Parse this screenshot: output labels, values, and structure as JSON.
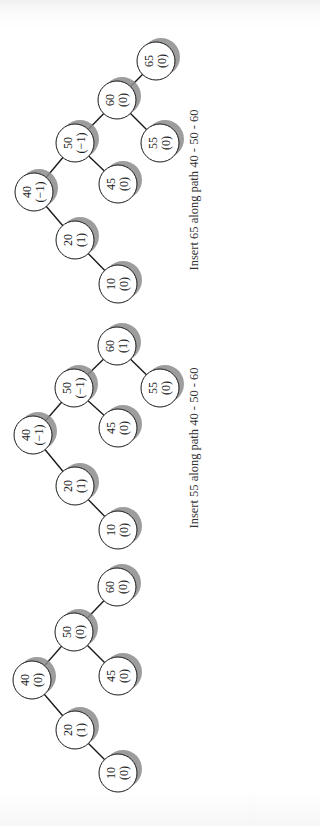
{
  "figure": {
    "orientation": "rotated -90deg (text reads bottom-to-top)",
    "node_radius": 19,
    "colors": {
      "node_fill": "#ffffff",
      "node_stroke": "#1a1a1a",
      "shadow": "#8c8c8c",
      "edge": "#1a1a1a",
      "text": "#222222"
    }
  },
  "trees": [
    {
      "id": "tree-insert-65",
      "caption": "Insert 65 along path 40 - 50 - 60",
      "caption_pos": {
        "x": 198,
        "y": 190
      },
      "nodes": [
        {
          "key": "65",
          "balance": "(0)",
          "x": 156,
          "y": 61
        },
        {
          "key": "60",
          "balance": "(0)",
          "x": 117,
          "y": 100
        },
        {
          "key": "50",
          "balance": "(−1)",
          "x": 75,
          "y": 143
        },
        {
          "key": "55",
          "balance": "(0)",
          "x": 160,
          "y": 143
        },
        {
          "key": "40",
          "balance": "(−1)",
          "x": 34,
          "y": 192
        },
        {
          "key": "45",
          "balance": "(0)",
          "x": 118,
          "y": 184
        },
        {
          "key": "20",
          "balance": "(1)",
          "x": 75,
          "y": 240
        },
        {
          "key": "10",
          "balance": "(0)",
          "x": 118,
          "y": 284
        }
      ],
      "edges": [
        [
          "60",
          "65"
        ],
        [
          "50",
          "60"
        ],
        [
          "60",
          "55"
        ],
        [
          "40",
          "50"
        ],
        [
          "50",
          "45"
        ],
        [
          "40",
          "20"
        ],
        [
          "20",
          "10"
        ]
      ]
    },
    {
      "id": "tree-insert-55",
      "caption": "Insert 55 along path 40 - 50 - 60",
      "caption_pos": {
        "x": 198,
        "y": 448
      },
      "nodes": [
        {
          "key": "60",
          "balance": "(1)",
          "x": 117,
          "y": 346
        },
        {
          "key": "50",
          "balance": "(−1)",
          "x": 74,
          "y": 388
        },
        {
          "key": "55",
          "balance": "(0)",
          "x": 160,
          "y": 388
        },
        {
          "key": "40",
          "balance": "(−1)",
          "x": 33,
          "y": 435
        },
        {
          "key": "45",
          "balance": "(0)",
          "x": 118,
          "y": 428
        },
        {
          "key": "20",
          "balance": "(1)",
          "x": 75,
          "y": 486
        },
        {
          "key": "10",
          "balance": "(0)",
          "x": 118,
          "y": 530
        }
      ],
      "edges": [
        [
          "50",
          "60"
        ],
        [
          "60",
          "55"
        ],
        [
          "40",
          "50"
        ],
        [
          "50",
          "45"
        ],
        [
          "40",
          "20"
        ],
        [
          "20",
          "10"
        ]
      ]
    },
    {
      "id": "tree-initial",
      "caption": "",
      "nodes": [
        {
          "key": "60",
          "balance": "(0)",
          "x": 117,
          "y": 587
        },
        {
          "key": "50",
          "balance": "(0)",
          "x": 74,
          "y": 632
        },
        {
          "key": "45",
          "balance": "(0)",
          "x": 118,
          "y": 676
        },
        {
          "key": "40",
          "balance": "(0)",
          "x": 32,
          "y": 680
        },
        {
          "key": "20",
          "balance": "(1)",
          "x": 75,
          "y": 730
        },
        {
          "key": "10",
          "balance": "(0)",
          "x": 118,
          "y": 773
        }
      ],
      "edges": [
        [
          "50",
          "60"
        ],
        [
          "40",
          "50"
        ],
        [
          "50",
          "45"
        ],
        [
          "40",
          "20"
        ],
        [
          "20",
          "10"
        ]
      ]
    }
  ]
}
